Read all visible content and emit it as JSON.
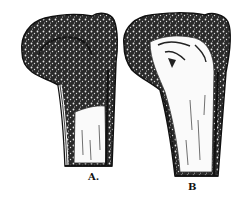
{
  "figure": {
    "background_color": "#ffffff",
    "ink_color": "#111111",
    "specimens": [
      {
        "id": "A",
        "label": "A.",
        "note": "spongy cancellous head with trabecular texture extending into shaft; hollow medullary canal below"
      },
      {
        "id": "B",
        "label": "B",
        "note": "spongy cap on head; large hollowed/rarefied interior extending through head and shaft"
      }
    ]
  }
}
